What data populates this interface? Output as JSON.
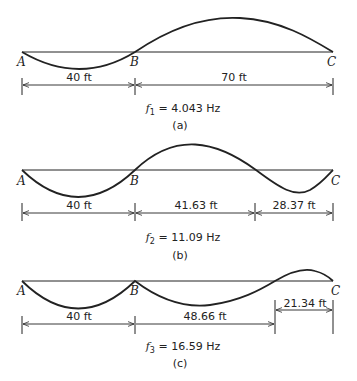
{
  "figure": {
    "panels": [
      {
        "id": "a",
        "caption": "(a)",
        "frequency": {
          "symbol": "f",
          "subscript": "1",
          "value": "= 4.043 Hz"
        },
        "points": [
          "A",
          "B",
          "C"
        ],
        "dimensions": [
          "40 ft",
          "70 ft"
        ]
      },
      {
        "id": "b",
        "caption": "(b)",
        "frequency": {
          "symbol": "f",
          "subscript": "2",
          "value": "= 11.09 Hz"
        },
        "points": [
          "A",
          "B",
          "C"
        ],
        "dimensions": [
          "40 ft",
          "41.63 ft",
          "28.37 ft"
        ]
      },
      {
        "id": "c",
        "caption": "(c)",
        "frequency": {
          "symbol": "f",
          "subscript": "3",
          "value": "= 16.59 Hz"
        },
        "points": [
          "A",
          "B",
          "C"
        ],
        "dimensions": [
          "40 ft",
          "48.66 ft",
          "21.34 ft"
        ]
      }
    ],
    "colors": {
      "line": "#222222",
      "background": "#ffffff"
    }
  }
}
